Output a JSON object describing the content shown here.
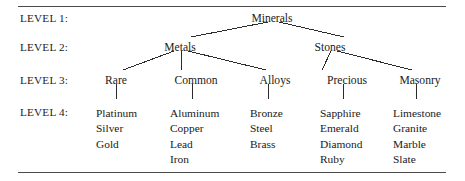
{
  "figure": {
    "rules": {
      "top_label": "top-rule",
      "bottom_label": "bottom-rule"
    },
    "level_labels": [
      {
        "label": "LEVEL 1:",
        "y": 12
      },
      {
        "label": "LEVEL 2:",
        "y": 41
      },
      {
        "label": "LEVEL 3:",
        "y": 74
      },
      {
        "label": "LEVEL 4:",
        "y": 106
      }
    ],
    "level1": [
      {
        "label": "Minerals",
        "x": 272,
        "y": 12
      }
    ],
    "level2": [
      {
        "label": "Metals",
        "x": 180,
        "y": 41
      },
      {
        "label": "Stones",
        "x": 330,
        "y": 41
      }
    ],
    "level3": [
      {
        "label": "Rare",
        "x": 116,
        "y": 74
      },
      {
        "label": "Common",
        "x": 196,
        "y": 74
      },
      {
        "label": "Alloys",
        "x": 275,
        "y": 74
      },
      {
        "label": "Precious",
        "x": 347,
        "y": 74
      },
      {
        "label": "Masonry",
        "x": 420,
        "y": 74
      }
    ],
    "level4": [
      {
        "parent": "Rare",
        "x": 96,
        "y": 106,
        "items": [
          "Platinum",
          "Silver",
          "Gold"
        ]
      },
      {
        "parent": "Common",
        "x": 170,
        "y": 106,
        "items": [
          "Aluminum",
          "Copper",
          "Lead",
          "Iron"
        ]
      },
      {
        "parent": "Alloys",
        "x": 250,
        "y": 106,
        "items": [
          "Bronze",
          "Steel",
          "Brass"
        ]
      },
      {
        "parent": "Precious",
        "x": 320,
        "y": 106,
        "items": [
          "Sapphire",
          "Emerald",
          "Diamond",
          "Ruby"
        ]
      },
      {
        "parent": "Masonry",
        "x": 393,
        "y": 106,
        "items": [
          "Limestone",
          "Granite",
          "Marble",
          "Slate"
        ]
      }
    ],
    "edges": [
      {
        "from": "Minerals",
        "to": "Metals",
        "x1": 268,
        "y1": 22,
        "x2": 191,
        "y2": 37
      },
      {
        "from": "Minerals",
        "to": "Stones",
        "x1": 279,
        "y1": 22,
        "x2": 344,
        "y2": 37
      },
      {
        "from": "Metals",
        "to": "Rare",
        "x1": 174,
        "y1": 51,
        "x2": 123,
        "y2": 70
      },
      {
        "from": "Metals",
        "to": "Common",
        "x1": 181,
        "y1": 51,
        "x2": 181,
        "y2": 70
      },
      {
        "from": "Metals",
        "to": "Alloys",
        "x1": 188,
        "y1": 51,
        "x2": 266,
        "y2": 70
      },
      {
        "from": "Stones",
        "to": "Precious",
        "x1": 331,
        "y1": 51,
        "x2": 322,
        "y2": 70
      },
      {
        "from": "Stones",
        "to": "Masonry",
        "x1": 337,
        "y1": 51,
        "x2": 412,
        "y2": 70
      },
      {
        "from": "Rare",
        "to": "Platinum",
        "x1": 116,
        "y1": 84,
        "x2": 116,
        "y2": 99
      },
      {
        "from": "Common",
        "to": "Aluminum",
        "x1": 192,
        "y1": 84,
        "x2": 192,
        "y2": 99
      },
      {
        "from": "Alloys",
        "to": "Bronze",
        "x1": 268,
        "y1": 84,
        "x2": 268,
        "y2": 99
      },
      {
        "from": "Precious",
        "to": "Sapphire",
        "x1": 343,
        "y1": 84,
        "x2": 343,
        "y2": 99
      },
      {
        "from": "Masonry",
        "to": "Limestone",
        "x1": 416,
        "y1": 84,
        "x2": 416,
        "y2": 99
      }
    ]
  },
  "colors": {
    "text": "#1a1a1a",
    "line": "#2b2b2b",
    "rule": "#4a4a4a",
    "background": "#ffffff"
  }
}
